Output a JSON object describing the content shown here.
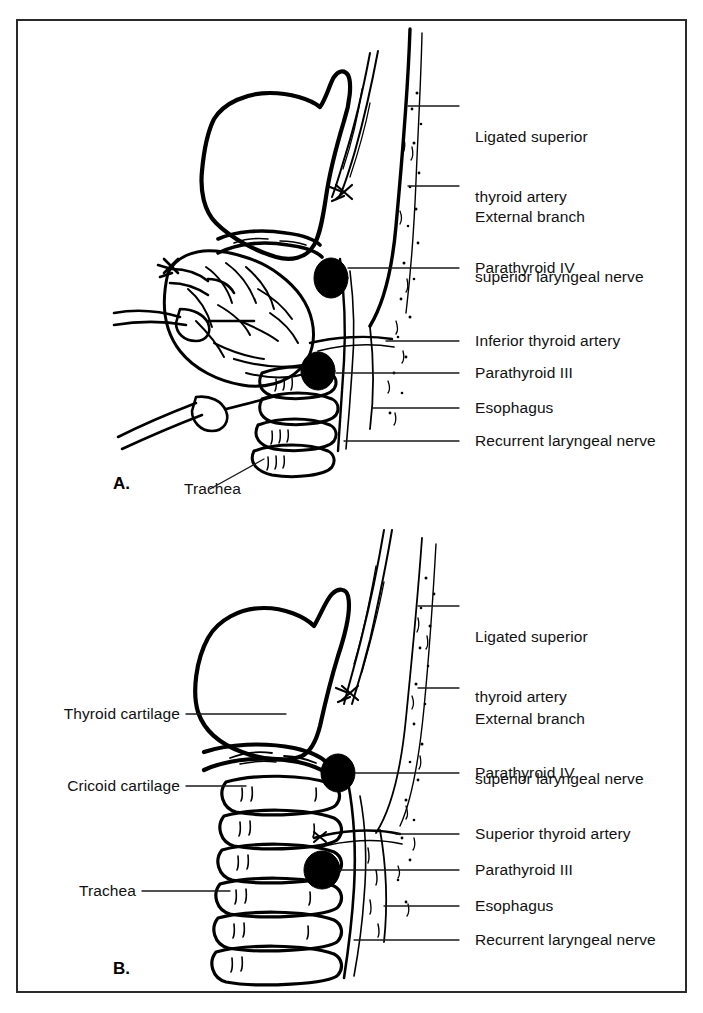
{
  "figure": {
    "background_color": "#ffffff",
    "ink_color": "#000000",
    "frame_color": "#2a2a2a"
  },
  "panels": [
    {
      "id": "A",
      "letter": "A.",
      "caption_note": "Thyroid gland in situ with superior thyroid artery ligated",
      "labels_right": [
        {
          "id": "ligated-superior-thyroid-artery",
          "lines": [
            "Ligated superior",
            "thyroid artery"
          ],
          "text": "Ligated superior thyroid artery"
        },
        {
          "id": "external-branch-superior-laryngeal-nerve",
          "lines": [
            "External branch",
            "superior laryngeal nerve"
          ],
          "text": "External branch superior laryngeal nerve"
        },
        {
          "id": "parathyroid-iv",
          "lines": [
            "Parathyroid IV"
          ],
          "text": "Parathyroid IV"
        },
        {
          "id": "inferior-thyroid-artery",
          "lines": [
            "Inferior thyroid artery"
          ],
          "text": "Inferior thyroid artery"
        },
        {
          "id": "parathyroid-iii",
          "lines": [
            "Parathyroid III"
          ],
          "text": "Parathyroid III"
        },
        {
          "id": "esophagus",
          "lines": [
            "Esophagus"
          ],
          "text": "Esophagus"
        },
        {
          "id": "recurrent-laryngeal-nerve",
          "lines": [
            "Recurrent laryngeal nerve"
          ],
          "text": "Recurrent laryngeal nerve"
        }
      ],
      "labels_left": [
        {
          "id": "trachea",
          "lines": [
            "Trachea"
          ],
          "text": "Trachea"
        }
      ]
    },
    {
      "id": "B",
      "letter": "B.",
      "caption_note": "Laryngotracheal skeleton after thyroid lobectomy",
      "labels_right": [
        {
          "id": "ligated-superior-thyroid-artery",
          "lines": [
            "Ligated superior",
            "thyroid artery"
          ],
          "text": "Ligated superior thyroid artery"
        },
        {
          "id": "external-branch-superior-laryngeal-nerve",
          "lines": [
            "External branch",
            "superior laryngeal nerve"
          ],
          "text": "External branch superior laryngeal nerve"
        },
        {
          "id": "parathyroid-iv",
          "lines": [
            "Parathyroid IV"
          ],
          "text": "Parathyroid IV"
        },
        {
          "id": "superior-thyroid-artery",
          "lines": [
            "Superior thyroid artery"
          ],
          "text": "Superior thyroid artery"
        },
        {
          "id": "parathyroid-iii",
          "lines": [
            "Parathyroid III"
          ],
          "text": "Parathyroid III"
        },
        {
          "id": "esophagus",
          "lines": [
            "Esophagus"
          ],
          "text": "Esophagus"
        },
        {
          "id": "recurrent-laryngeal-nerve",
          "lines": [
            "Recurrent laryngeal nerve"
          ],
          "text": "Recurrent laryngeal nerve"
        }
      ],
      "labels_left": [
        {
          "id": "thyroid-cartilage",
          "lines": [
            "Thyroid cartilage"
          ],
          "text": "Thyroid cartilage"
        },
        {
          "id": "cricoid-cartilage",
          "lines": [
            "Cricoid cartilage"
          ],
          "text": "Cricoid cartilage"
        },
        {
          "id": "trachea",
          "lines": [
            "Trachea"
          ],
          "text": "Trachea"
        }
      ]
    }
  ],
  "panel_a_text": {
    "letter": "A.",
    "l1a": "Ligated superior",
    "l1b": "thyroid artery",
    "l2a": "External branch",
    "l2b": "superior laryngeal nerve",
    "l3": "Parathyroid IV",
    "l4": "Inferior thyroid artery",
    "l5": "Parathyroid III",
    "l6": "Esophagus",
    "l7": "Recurrent laryngeal nerve",
    "trachea": "Trachea"
  },
  "panel_b_text": {
    "letter": "B.",
    "l1a": "Ligated superior",
    "l1b": "thyroid artery",
    "l2a": "External branch",
    "l2b": "superior laryngeal nerve",
    "l3": "Parathyroid IV",
    "l4": "Superior thyroid artery",
    "l5": "Parathyroid III",
    "l6": "Esophagus",
    "l7": "Recurrent laryngeal nerve",
    "thyroid_cartilage": "Thyroid cartilage",
    "cricoid_cartilage": "Cricoid cartilage",
    "trachea": "Trachea"
  }
}
